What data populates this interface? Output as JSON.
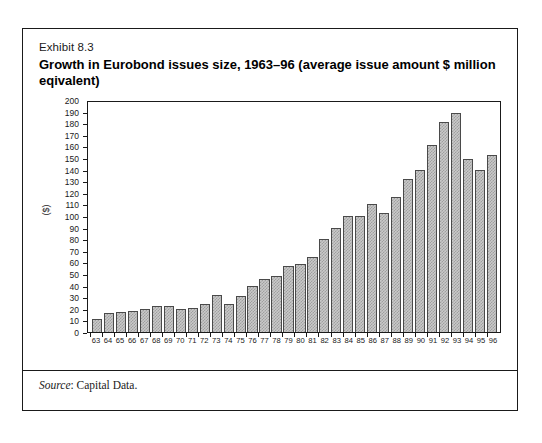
{
  "exhibit": {
    "label": "Exhibit 8.3",
    "title": "Growth in Eurobond issues size, 1963–96 (average issue amount $ million eqivalent)",
    "source_word": "Source",
    "source_rest": ": Capital Data."
  },
  "colors": {
    "frame": "#1a1a1a",
    "bar_fill": "#c9c9c9",
    "bar_pattern": "#9f9f9f",
    "bar_outline": "#4a4a4a",
    "text": "#1a1a1a",
    "background": "#ffffff"
  },
  "chart_data": {
    "type": "bar",
    "title": "Growth in Eurobond issues size, 1963–96 (average issue amount $ million eqivalent)",
    "xlabel": "",
    "ylabel": "($)",
    "ylim": [
      0,
      200
    ],
    "ytick_step": 10,
    "grid": false,
    "legend": "none",
    "categories": [
      "63",
      "64",
      "65",
      "66",
      "67",
      "68",
      "69",
      "70",
      "71",
      "72",
      "73",
      "74",
      "75",
      "76",
      "77",
      "78",
      "79",
      "80",
      "81",
      "82",
      "83",
      "84",
      "85",
      "86",
      "87",
      "88",
      "89",
      "90",
      "91",
      "92",
      "93",
      "94",
      "95",
      "96"
    ],
    "values": [
      11,
      16,
      17,
      18,
      20,
      22,
      22,
      20,
      21,
      24,
      32,
      24,
      31,
      40,
      46,
      48,
      57,
      59,
      65,
      80,
      90,
      100,
      100,
      110,
      103,
      116,
      132,
      140,
      161,
      181,
      189,
      149,
      140,
      153
    ],
    "yticks": [
      "200",
      "190",
      "180",
      "170",
      "160",
      "150",
      "140",
      "130",
      "120",
      "110",
      "100",
      "90",
      "80",
      "70",
      "60",
      "50",
      "40",
      "30",
      "20",
      "10",
      "0"
    ]
  }
}
